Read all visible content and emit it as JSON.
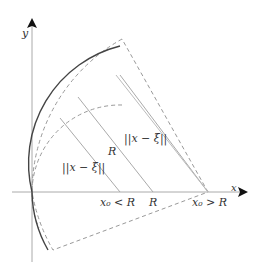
{
  "diagram": {
    "axes": {
      "x_label": "x",
      "y_label": "y"
    },
    "labels": {
      "norm_inner": "||x − ξ||",
      "norm_outer": "||x − ξ||",
      "radius": "R",
      "x0_less": "x₀ < R",
      "r_tick": "R",
      "x0_greater": "x₀ > R"
    },
    "colors": {
      "axis": "#999999",
      "solid_arc": "#444444",
      "dashed": "#999999",
      "rays": "#aaaaaa"
    }
  }
}
